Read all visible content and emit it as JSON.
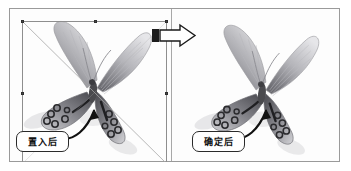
{
  "figure": {
    "type": "before-after-comparison",
    "title": "",
    "background_color": "#ffffff",
    "frame_color": "#9a9a9a"
  },
  "panels": [
    {
      "id": "left",
      "name": "before-panel",
      "label": "置入后",
      "label_meaning": "after placing",
      "has_selection_box": true,
      "selection": {
        "handle_count": 8,
        "handle_color": "#2e2e2e",
        "border_color": "#8e8e8e",
        "diagonals_visible": true
      },
      "image_subject": "butterfly"
    },
    {
      "id": "right",
      "name": "after-panel",
      "label": "确定后",
      "label_meaning": "after confirming",
      "has_selection_box": false,
      "image_subject": "butterfly"
    }
  ],
  "transition": {
    "icon": "right-arrow-icon",
    "direction": "right",
    "fill": "#ffffff",
    "stroke": "#1a1a1a",
    "block_color": "#1c1c1c"
  },
  "annotations": [
    {
      "name": "callout-left",
      "text": "置入后",
      "arrow": "curved-arrow-icon",
      "arrow_direction": "up-right"
    },
    {
      "name": "callout-right",
      "text": "确定后",
      "arrow": "curved-arrow-icon",
      "arrow_direction": "up-right"
    }
  ],
  "colors": {
    "wing_dark": "#5d5d62",
    "wing_mid": "#8b8b90",
    "wing_light": "#cfcfd3",
    "spot_ring": "#2b2b2e",
    "body": "#4a4a4e",
    "shadow": "#c9c9cc",
    "text": "#111111"
  }
}
